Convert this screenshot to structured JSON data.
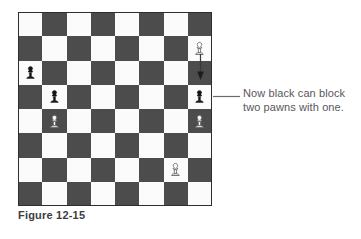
{
  "figure": {
    "caption": "Figure 12-15",
    "colors": {
      "light_square": "#fbfbfb",
      "dark_square": "#4c4c4c",
      "black_pawn": "#141414",
      "white_pawn_outline": "#6e6e70",
      "white_pawn_fill": "#fbfbfb",
      "annotation": "#58585a",
      "caption": "#3d3d3f",
      "background": "#ffffff"
    }
  },
  "callout": {
    "lines": [
      "Now black can block",
      "two pawns with one."
    ],
    "leader_from": "r4c8",
    "leader_label": "leader-line"
  },
  "arrow": {
    "name": "move-arrow",
    "from": "r2c8",
    "to": "r4c8",
    "direction": "down"
  },
  "chart_data": {
    "type": "table",
    "title": "Figure 12-15",
    "rows": 8,
    "columns": 8,
    "first_square_color": "light",
    "square_colors": [
      [
        "light",
        "dark",
        "light",
        "dark",
        "light",
        "dark",
        "light",
        "dark"
      ],
      [
        "dark",
        "light",
        "dark",
        "light",
        "dark",
        "light",
        "dark",
        "light"
      ],
      [
        "light",
        "dark",
        "light",
        "dark",
        "light",
        "dark",
        "light",
        "dark"
      ],
      [
        "dark",
        "light",
        "dark",
        "light",
        "dark",
        "light",
        "dark",
        "light"
      ],
      [
        "light",
        "dark",
        "light",
        "dark",
        "light",
        "dark",
        "light",
        "dark"
      ],
      [
        "dark",
        "light",
        "dark",
        "light",
        "dark",
        "light",
        "dark",
        "light"
      ],
      [
        "light",
        "dark",
        "light",
        "dark",
        "light",
        "dark",
        "light",
        "dark"
      ],
      [
        "dark",
        "light",
        "dark",
        "light",
        "dark",
        "light",
        "dark",
        "light"
      ]
    ],
    "pieces": [
      {
        "row": 2,
        "col": 8,
        "piece": "pawn",
        "color": "white",
        "name": "white-pawn-r2c8"
      },
      {
        "row": 3,
        "col": 1,
        "piece": "pawn",
        "color": "black",
        "name": "black-pawn-r3c1"
      },
      {
        "row": 4,
        "col": 2,
        "piece": "pawn",
        "color": "black",
        "name": "black-pawn-r4c2"
      },
      {
        "row": 4,
        "col": 8,
        "piece": "pawn",
        "color": "black",
        "name": "black-pawn-r4c8"
      },
      {
        "row": 5,
        "col": 2,
        "piece": "pawn",
        "color": "white",
        "name": "white-pawn-r5c2"
      },
      {
        "row": 5,
        "col": 8,
        "piece": "pawn",
        "color": "white",
        "name": "white-pawn-r5c8"
      },
      {
        "row": 7,
        "col": 7,
        "piece": "pawn",
        "color": "white",
        "name": "white-pawn-r7c7"
      }
    ],
    "annotations": [
      {
        "type": "arrow",
        "from": "r2c8",
        "to": "r4c8"
      },
      {
        "type": "callout",
        "target": "r4c8",
        "text": "Now black can block two pawns with one."
      }
    ]
  }
}
